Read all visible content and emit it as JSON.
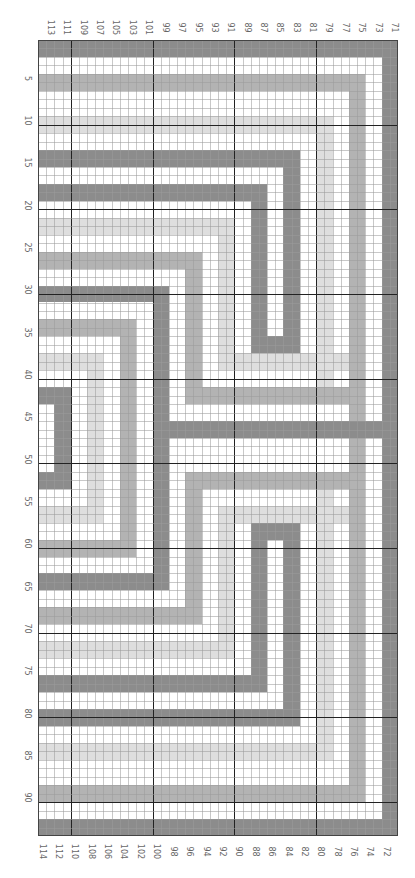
{
  "chart_data": {
    "type": "heatmap",
    "title": "",
    "columns": 44,
    "rows": 94,
    "top_axis_labels": [
      "113",
      "111",
      "109",
      "107",
      "105",
      "103",
      "101",
      "99",
      "97",
      "95",
      "93",
      "91",
      "89",
      "87",
      "85",
      "83",
      "81",
      "79",
      "77",
      "75",
      "73",
      "71"
    ],
    "bottom_axis_labels": [
      "114",
      "112",
      "110",
      "108",
      "106",
      "104",
      "102",
      "100",
      "98",
      "96",
      "94",
      "92",
      "90",
      "88",
      "86",
      "84",
      "82",
      "80",
      "78",
      "76",
      "74",
      "72"
    ],
    "left_axis_labels": [
      "5",
      "10",
      "15",
      "20",
      "25",
      "30",
      "35",
      "40",
      "45",
      "50",
      "55",
      "60",
      "65",
      "70",
      "75",
      "80",
      "85",
      "90"
    ],
    "colors": {
      "dark": "#8c8c8c",
      "medium": "#b3b3b3",
      "light": "#dedede",
      "white": "#ffffff"
    },
    "major_grid_every": 10,
    "shapes": [
      {
        "shade": "dark",
        "c0": 0,
        "c1": 43,
        "r0": 0,
        "r1": 1
      },
      {
        "shade": "dark",
        "c0": 42,
        "c1": 43,
        "r0": 0,
        "r1": 93
      },
      {
        "shade": "dark",
        "c0": 0,
        "c1": 43,
        "r0": 92,
        "r1": 93
      },
      {
        "shade": "medium",
        "c0": 0,
        "c1": 39,
        "r0": 4,
        "r1": 5
      },
      {
        "shade": "medium",
        "c0": 38,
        "c1": 39,
        "r0": 4,
        "r1": 89
      },
      {
        "shade": "medium",
        "c0": 0,
        "c1": 39,
        "r0": 88,
        "r1": 89
      },
      {
        "shade": "light",
        "c0": 0,
        "c1": 35,
        "r0": 9,
        "r1": 10
      },
      {
        "shade": "light",
        "c0": 34,
        "c1": 35,
        "r0": 9,
        "r1": 42
      },
      {
        "shade": "light",
        "c0": 34,
        "c1": 35,
        "r0": 51,
        "r1": 84
      },
      {
        "shade": "light",
        "c0": 0,
        "c1": 35,
        "r0": 83,
        "r1": 84
      },
      {
        "shade": "dark",
        "c0": 0,
        "c1": 31,
        "r0": 13,
        "r1": 14
      },
      {
        "shade": "dark",
        "c0": 30,
        "c1": 31,
        "r0": 13,
        "r1": 36
      },
      {
        "shade": "dark",
        "c0": 26,
        "c1": 31,
        "r0": 35,
        "r1": 36
      },
      {
        "shade": "dark",
        "c0": 26,
        "c1": 27,
        "r0": 17,
        "r1": 36
      },
      {
        "shade": "dark",
        "c0": 0,
        "c1": 27,
        "r0": 17,
        "r1": 18
      },
      {
        "shade": "dark",
        "c0": 0,
        "c1": 31,
        "r0": 79,
        "r1": 80
      },
      {
        "shade": "dark",
        "c0": 30,
        "c1": 31,
        "r0": 57,
        "r1": 80
      },
      {
        "shade": "dark",
        "c0": 26,
        "c1": 31,
        "r0": 57,
        "r1": 58
      },
      {
        "shade": "dark",
        "c0": 26,
        "c1": 27,
        "r0": 57,
        "r1": 76
      },
      {
        "shade": "dark",
        "c0": 0,
        "c1": 27,
        "r0": 75,
        "r1": 76
      },
      {
        "shade": "light",
        "c0": 0,
        "c1": 23,
        "r0": 21,
        "r1": 22
      },
      {
        "shade": "light",
        "c0": 22,
        "c1": 23,
        "r0": 21,
        "r1": 38
      },
      {
        "shade": "light",
        "c0": 22,
        "c1": 37,
        "r0": 37,
        "r1": 38
      },
      {
        "shade": "light",
        "c0": 0,
        "c1": 23,
        "r0": 71,
        "r1": 72
      },
      {
        "shade": "light",
        "c0": 22,
        "c1": 23,
        "r0": 55,
        "r1": 72
      },
      {
        "shade": "light",
        "c0": 22,
        "c1": 37,
        "r0": 55,
        "r1": 56
      },
      {
        "shade": "medium",
        "c0": 0,
        "c1": 19,
        "r0": 25,
        "r1": 26
      },
      {
        "shade": "medium",
        "c0": 18,
        "c1": 19,
        "r0": 25,
        "r1": 42
      },
      {
        "shade": "medium",
        "c0": 18,
        "c1": 39,
        "r0": 41,
        "r1": 42
      },
      {
        "shade": "medium",
        "c0": 0,
        "c1": 19,
        "r0": 67,
        "r1": 68
      },
      {
        "shade": "medium",
        "c0": 18,
        "c1": 19,
        "r0": 51,
        "r1": 68
      },
      {
        "shade": "medium",
        "c0": 18,
        "c1": 39,
        "r0": 51,
        "r1": 52
      },
      {
        "shade": "dark",
        "c0": 0,
        "c1": 15,
        "r0": 29,
        "r1": 30
      },
      {
        "shade": "dark",
        "c0": 14,
        "c1": 15,
        "r0": 29,
        "r1": 64
      },
      {
        "shade": "dark",
        "c0": 14,
        "c1": 43,
        "r0": 45,
        "r1": 46
      },
      {
        "shade": "dark",
        "c0": 0,
        "c1": 15,
        "r0": 63,
        "r1": 64
      },
      {
        "shade": "medium",
        "c0": 0,
        "c1": 11,
        "r0": 33,
        "r1": 34
      },
      {
        "shade": "medium",
        "c0": 10,
        "c1": 11,
        "r0": 33,
        "r1": 60
      },
      {
        "shade": "medium",
        "c0": 0,
        "c1": 11,
        "r0": 59,
        "r1": 60
      },
      {
        "shade": "light",
        "c0": 0,
        "c1": 7,
        "r0": 37,
        "r1": 38
      },
      {
        "shade": "light",
        "c0": 6,
        "c1": 7,
        "r0": 37,
        "r1": 56
      },
      {
        "shade": "light",
        "c0": 0,
        "c1": 7,
        "r0": 55,
        "r1": 56
      },
      {
        "shade": "dark",
        "c0": 0,
        "c1": 3,
        "r0": 41,
        "r1": 42
      },
      {
        "shade": "dark",
        "c0": 2,
        "c1": 3,
        "r0": 41,
        "r1": 52
      },
      {
        "shade": "dark",
        "c0": 0,
        "c1": 3,
        "r0": 51,
        "r1": 52
      }
    ]
  }
}
